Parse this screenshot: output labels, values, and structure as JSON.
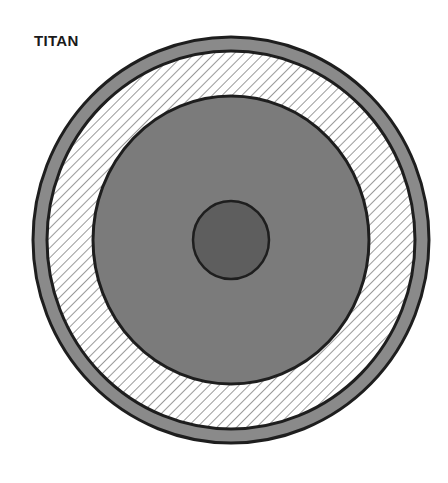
{
  "title": "TITAN",
  "diagram": {
    "type": "planetary-interior-cross-section",
    "center": [
      231,
      240
    ],
    "layers": [
      {
        "name": "crust",
        "rx": 198,
        "ry": 203,
        "fill": "#8a8a8a",
        "stroke": "#1e1e1e"
      },
      {
        "name": "ice-shell",
        "rx": 184,
        "ry": 189,
        "fill": "hatched",
        "stroke": "#1e1e1e"
      },
      {
        "name": "mantle",
        "rx": 138,
        "ry": 144,
        "fill": "#7b7b7b",
        "stroke": "#1e1e1e"
      },
      {
        "name": "core",
        "rx": 38,
        "ry": 39,
        "fill": "#5e5e5e",
        "stroke": "#1e1e1e"
      }
    ]
  }
}
